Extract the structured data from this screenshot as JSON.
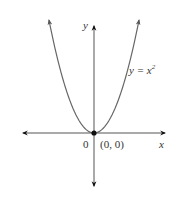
{
  "chart_data": {
    "type": "line",
    "title": "",
    "function_label": "y = x",
    "function_exponent": "2",
    "xlabel": "x",
    "ylabel": "y",
    "origin_label": "0",
    "point_label": "(0, 0)",
    "points": [
      {
        "x": -2,
        "y": 4
      },
      {
        "x": -1.5,
        "y": 2.25
      },
      {
        "x": -1,
        "y": 1
      },
      {
        "x": -0.5,
        "y": 0.25
      },
      {
        "x": 0,
        "y": 0
      },
      {
        "x": 0.5,
        "y": 0.25
      },
      {
        "x": 1,
        "y": 1
      },
      {
        "x": 1.5,
        "y": 2.25
      },
      {
        "x": 2,
        "y": 4
      }
    ],
    "highlighted_point": {
      "x": 0,
      "y": 0
    },
    "grid": false,
    "axis_arrows": true
  },
  "colors": {
    "curve": "#555555",
    "axis": "#444444",
    "point": "#111111",
    "text": "#333333"
  }
}
